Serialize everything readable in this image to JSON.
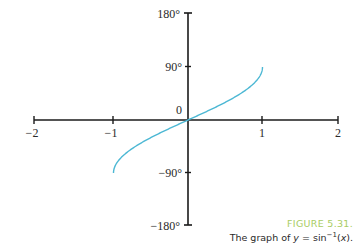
{
  "chart_data": {
    "type": "line",
    "title": "",
    "xlabel": "",
    "ylabel": "",
    "xlim": [
      -2,
      2
    ],
    "ylim": [
      -180,
      180
    ],
    "grid": false,
    "x_ticks": [
      -2,
      -1,
      1,
      2
    ],
    "x_tick_labels": [
      "−2",
      "−1",
      "1",
      "2"
    ],
    "y_ticks": [
      180,
      90,
      -90,
      -180
    ],
    "y_tick_labels": [
      "180°",
      "90°",
      "−90°",
      "−180°"
    ],
    "origin_label": "0",
    "series": [
      {
        "name": "y = sin⁻¹(x)",
        "color": "#4db8d4",
        "x": [
          -1,
          -0.9,
          -0.75,
          -0.5,
          -0.25,
          0,
          0.25,
          0.5,
          0.75,
          0.9,
          1
        ],
        "y": [
          -90,
          -64.2,
          -48.6,
          -30,
          -14.5,
          0,
          14.5,
          30,
          48.6,
          64.2,
          90
        ]
      }
    ]
  },
  "caption": {
    "figure_number": "FIGURE 5.31.",
    "text_prefix": "The graph of ",
    "var": "y",
    "text_mid": " = sin",
    "superscript": "−1",
    "text_open": "(",
    "arg": "x",
    "text_close": ")."
  },
  "colors": {
    "axis": "#1a1a1a",
    "curve": "#4db8d4",
    "figure_number": "#a8cc62"
  }
}
